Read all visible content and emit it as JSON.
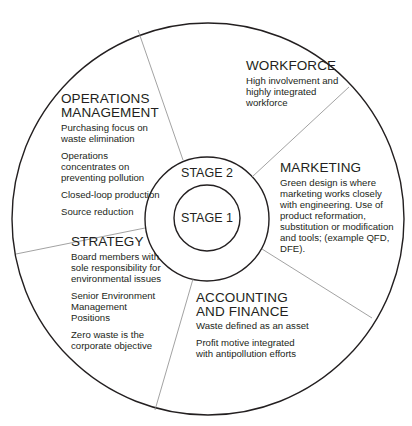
{
  "diagram": {
    "stages": {
      "inner": "STAGE 1",
      "middle": "STAGE 2"
    },
    "sections": {
      "workforce": {
        "title": "WORKFORCE",
        "items": [
          "High involvement and highly integrated workforce"
        ],
        "lines": [
          "High involvement and",
          "highly integrated",
          "workforce"
        ]
      },
      "operations": {
        "title_lines": [
          "OPERATIONS",
          "MANAGEMENT"
        ],
        "lines": [
          [
            "Purchasing focus on",
            "waste elimination"
          ],
          [
            "Operations",
            "concentrates on",
            "preventing pollution"
          ],
          [
            "Closed-loop production"
          ],
          [
            "Source reduction"
          ]
        ]
      },
      "marketing": {
        "title": "MARKETING",
        "lines": [
          "Green design is where",
          "marketing works closely",
          "with engineering. Use of",
          "product reformation,",
          "substitution or modification",
          "and tools; (example QFD,",
          "DFE)."
        ]
      },
      "strategy": {
        "title": "STRATEGY",
        "lines": [
          [
            "Board members with",
            "sole responsibility for",
            "environmental issues"
          ],
          [
            "Senior Environment",
            "Management",
            "Positions"
          ],
          [
            "Zero waste is the",
            "corporate objective"
          ]
        ]
      },
      "accounting": {
        "title_lines": [
          "ACCOUNTING",
          "AND FINANCE"
        ],
        "lines": [
          [
            "Waste defined as an asset"
          ],
          [
            "Profit motive integrated",
            "with antipollution efforts"
          ]
        ]
      }
    },
    "colors": {
      "stroke": "#231f20",
      "divider": "#8a8a8a",
      "text": "#231f20"
    }
  }
}
